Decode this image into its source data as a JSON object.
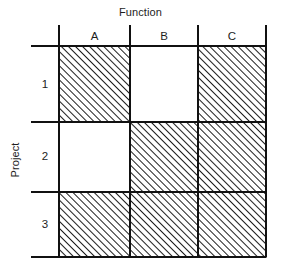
{
  "figure": {
    "column_axis_title": "Function",
    "row_axis_title": "Project",
    "column_labels": [
      "A",
      "B",
      "C"
    ],
    "row_labels": [
      "1",
      "2",
      "3"
    ],
    "line_color": "#111111",
    "hatch_color": "#111111",
    "background_color": "#ffffff"
  },
  "chart_data": {
    "type": "table",
    "title": "",
    "xlabel": "Function",
    "ylabel": "Project",
    "categories": [
      "A",
      "B",
      "C"
    ],
    "rows": [
      "1",
      "2",
      "3"
    ],
    "legend": [
      "hatched = assigned",
      "blank = not assigned"
    ],
    "cells": [
      {
        "row": "1",
        "column": "A",
        "filled": true,
        "fill": "hatch-45"
      },
      {
        "row": "1",
        "column": "B",
        "filled": false,
        "fill": "none"
      },
      {
        "row": "1",
        "column": "C",
        "filled": true,
        "fill": "hatch-45"
      },
      {
        "row": "2",
        "column": "A",
        "filled": false,
        "fill": "none"
      },
      {
        "row": "2",
        "column": "B",
        "filled": true,
        "fill": "hatch-45"
      },
      {
        "row": "2",
        "column": "C",
        "filled": true,
        "fill": "hatch-45"
      },
      {
        "row": "3",
        "column": "A",
        "filled": true,
        "fill": "hatch-45"
      },
      {
        "row": "3",
        "column": "B",
        "filled": true,
        "fill": "hatch-45"
      },
      {
        "row": "3",
        "column": "C",
        "filled": true,
        "fill": "hatch-45"
      }
    ],
    "values": [
      [
        1,
        0,
        1
      ],
      [
        0,
        1,
        1
      ],
      [
        1,
        1,
        1
      ]
    ],
    "grid": true,
    "legend_position": "none"
  }
}
